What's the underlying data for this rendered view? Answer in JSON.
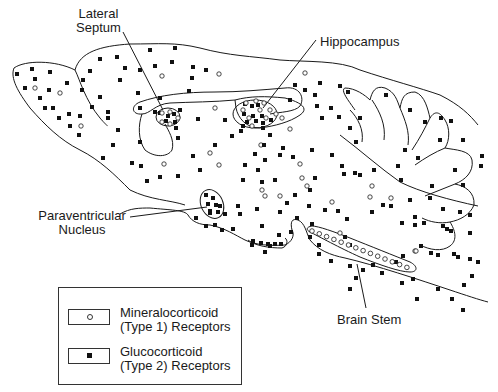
{
  "labels": {
    "lateral_septum": [
      "Lateral",
      "Septum"
    ],
    "hippocampus": "Hippocampus",
    "paraventricular_nucleus": [
      "Paraventricular",
      "Nucleus"
    ],
    "brain_stem": "Brain Stem"
  },
  "legend": {
    "items": [
      {
        "symbol": "open-circle",
        "line1": "Mineralocorticoid",
        "line2": "(Type 1)  Receptors"
      },
      {
        "symbol": "filled-square",
        "line1": "Glucocorticoid",
        "line2": "(Type 2)  Receptors"
      }
    ]
  },
  "colors": {
    "ink": "#1a1a1a",
    "background": "#ffffff"
  },
  "markers": {
    "open_circles": [
      [
        35,
        88
      ],
      [
        60,
        93
      ],
      [
        81,
        126
      ],
      [
        162,
        76
      ],
      [
        219,
        74
      ],
      [
        215,
        108
      ],
      [
        210,
        153
      ],
      [
        164,
        164
      ],
      [
        219,
        165
      ],
      [
        261,
        145
      ],
      [
        265,
        196
      ],
      [
        305,
        73
      ],
      [
        290,
        129
      ],
      [
        300,
        164
      ],
      [
        302,
        178
      ],
      [
        307,
        186
      ],
      [
        332,
        202
      ],
      [
        340,
        233
      ],
      [
        372,
        186
      ],
      [
        370,
        197
      ],
      [
        391,
        198
      ],
      [
        262,
        190
      ],
      [
        280,
        196
      ],
      [
        415,
        251
      ],
      [
        416,
        251
      ]
    ],
    "solid_squares": [
      [
        17,
        74
      ],
      [
        32,
        69
      ],
      [
        50,
        72
      ],
      [
        35,
        79
      ],
      [
        25,
        88
      ],
      [
        49,
        90
      ],
      [
        67,
        83
      ],
      [
        40,
        98
      ],
      [
        45,
        108
      ],
      [
        53,
        108
      ],
      [
        59,
        118
      ],
      [
        69,
        114
      ],
      [
        80,
        116
      ],
      [
        70,
        126
      ],
      [
        79,
        135
      ],
      [
        90,
        71
      ],
      [
        100,
        59
      ],
      [
        150,
        50
      ],
      [
        175,
        48
      ],
      [
        117,
        57
      ],
      [
        125,
        68
      ],
      [
        140,
        70
      ],
      [
        155,
        66
      ],
      [
        172,
        62
      ],
      [
        193,
        67
      ],
      [
        206,
        70
      ],
      [
        83,
        80
      ],
      [
        82,
        90
      ],
      [
        100,
        97
      ],
      [
        92,
        107
      ],
      [
        108,
        112
      ],
      [
        120,
        80
      ],
      [
        138,
        93
      ],
      [
        108,
        118
      ],
      [
        118,
        130
      ],
      [
        140,
        108
      ],
      [
        155,
        112
      ],
      [
        160,
        98
      ],
      [
        192,
        78
      ],
      [
        189,
        91
      ],
      [
        180,
        110
      ],
      [
        176,
        128
      ],
      [
        198,
        119
      ],
      [
        215,
        145
      ],
      [
        232,
        136
      ],
      [
        225,
        120
      ],
      [
        178,
        138
      ],
      [
        140,
        142
      ],
      [
        113,
        145
      ],
      [
        132,
        163
      ],
      [
        141,
        166
      ],
      [
        103,
        158
      ],
      [
        147,
        181
      ],
      [
        160,
        177
      ],
      [
        178,
        176
      ],
      [
        200,
        170
      ],
      [
        193,
        156
      ],
      [
        243,
        126
      ],
      [
        263,
        128
      ],
      [
        270,
        135
      ],
      [
        264,
        145
      ],
      [
        241,
        131
      ],
      [
        245,
        165
      ],
      [
        255,
        154
      ],
      [
        265,
        160
      ],
      [
        243,
        180
      ],
      [
        258,
        170
      ],
      [
        275,
        180
      ],
      [
        262,
        182
      ],
      [
        290,
        100
      ],
      [
        305,
        90
      ],
      [
        295,
        85
      ],
      [
        315,
        95
      ],
      [
        320,
        83
      ],
      [
        340,
        86
      ],
      [
        348,
        92
      ],
      [
        331,
        108
      ],
      [
        317,
        106
      ],
      [
        322,
        118
      ],
      [
        339,
        117
      ],
      [
        360,
        118
      ],
      [
        350,
        128
      ],
      [
        356,
        142
      ],
      [
        280,
        155
      ],
      [
        283,
        148
      ],
      [
        293,
        157
      ],
      [
        312,
        150
      ],
      [
        332,
        155
      ],
      [
        342,
        166
      ],
      [
        344,
        174
      ],
      [
        315,
        178
      ],
      [
        310,
        190
      ],
      [
        295,
        195
      ],
      [
        287,
        203
      ],
      [
        257,
        209
      ],
      [
        280,
        212
      ],
      [
        309,
        206
      ],
      [
        297,
        218
      ],
      [
        325,
        210
      ],
      [
        338,
        211
      ],
      [
        355,
        173
      ],
      [
        386,
        95
      ],
      [
        410,
        110
      ],
      [
        425,
        122
      ],
      [
        405,
        150
      ],
      [
        398,
        166
      ],
      [
        418,
        158
      ],
      [
        441,
        118
      ],
      [
        451,
        121
      ],
      [
        440,
        140
      ],
      [
        463,
        140
      ],
      [
        482,
        156
      ],
      [
        481,
        166
      ],
      [
        455,
        170
      ],
      [
        463,
        185
      ],
      [
        432,
        186
      ],
      [
        443,
        209
      ],
      [
        460,
        212
      ],
      [
        470,
        215
      ],
      [
        430,
        198
      ],
      [
        410,
        200
      ],
      [
        360,
        175
      ],
      [
        374,
        170
      ],
      [
        401,
        180
      ],
      [
        372,
        212
      ],
      [
        383,
        205
      ],
      [
        391,
        206
      ],
      [
        402,
        223
      ],
      [
        454,
        254
      ],
      [
        443,
        226
      ],
      [
        470,
        259
      ],
      [
        478,
        262
      ],
      [
        403,
        256
      ],
      [
        415,
        217
      ],
      [
        424,
        223
      ],
      [
        447,
        229
      ],
      [
        415,
        225
      ],
      [
        431,
        253
      ],
      [
        451,
        231
      ],
      [
        470,
        233
      ],
      [
        345,
        237
      ],
      [
        319,
        245
      ],
      [
        319,
        254
      ],
      [
        331,
        261
      ],
      [
        350,
        266
      ],
      [
        350,
        289
      ],
      [
        356,
        278
      ],
      [
        363,
        270
      ],
      [
        373,
        265
      ],
      [
        382,
        273
      ],
      [
        396,
        262
      ],
      [
        413,
        279
      ],
      [
        421,
        246
      ],
      [
        438,
        255
      ],
      [
        458,
        257
      ],
      [
        472,
        276
      ],
      [
        464,
        285
      ],
      [
        452,
        299
      ],
      [
        463,
        310
      ],
      [
        438,
        289
      ],
      [
        417,
        299
      ],
      [
        402,
        283
      ],
      [
        347,
        219
      ],
      [
        312,
        224
      ],
      [
        310,
        237
      ],
      [
        350,
        245
      ],
      [
        262,
        226
      ],
      [
        279,
        235
      ],
      [
        291,
        232
      ],
      [
        238,
        206
      ],
      [
        240,
        214
      ],
      [
        225,
        214
      ],
      [
        210,
        213
      ],
      [
        196,
        218
      ],
      [
        206,
        226
      ],
      [
        215,
        225
      ],
      [
        222,
        230
      ],
      [
        233,
        229
      ],
      [
        252,
        245
      ],
      [
        265,
        252
      ],
      [
        270,
        246
      ]
    ],
    "solid_dense_clusters": {
      "septum": [
        [
          160,
          113
        ],
        [
          168,
          116
        ],
        [
          174,
          114
        ],
        [
          166,
          121
        ],
        [
          175,
          122
        ]
      ],
      "hippocampus": [
        [
          245,
          104
        ],
        [
          252,
          106
        ],
        [
          258,
          105
        ],
        [
          244,
          114
        ],
        [
          253,
          116
        ],
        [
          262,
          116
        ],
        [
          247,
          122
        ],
        [
          256,
          121
        ],
        [
          263,
          123
        ],
        [
          271,
          120
        ]
      ],
      "pvn": [
        [
          206,
          195
        ],
        [
          213,
          198
        ],
        [
          208,
          204
        ],
        [
          216,
          205
        ],
        [
          210,
          211
        ],
        [
          218,
          212
        ],
        [
          220,
          206
        ]
      ],
      "median_eminence": [
        [
          253,
          241
        ],
        [
          261,
          243
        ],
        [
          268,
          244
        ],
        [
          275,
          244
        ],
        [
          281,
          244
        ]
      ]
    }
  }
}
